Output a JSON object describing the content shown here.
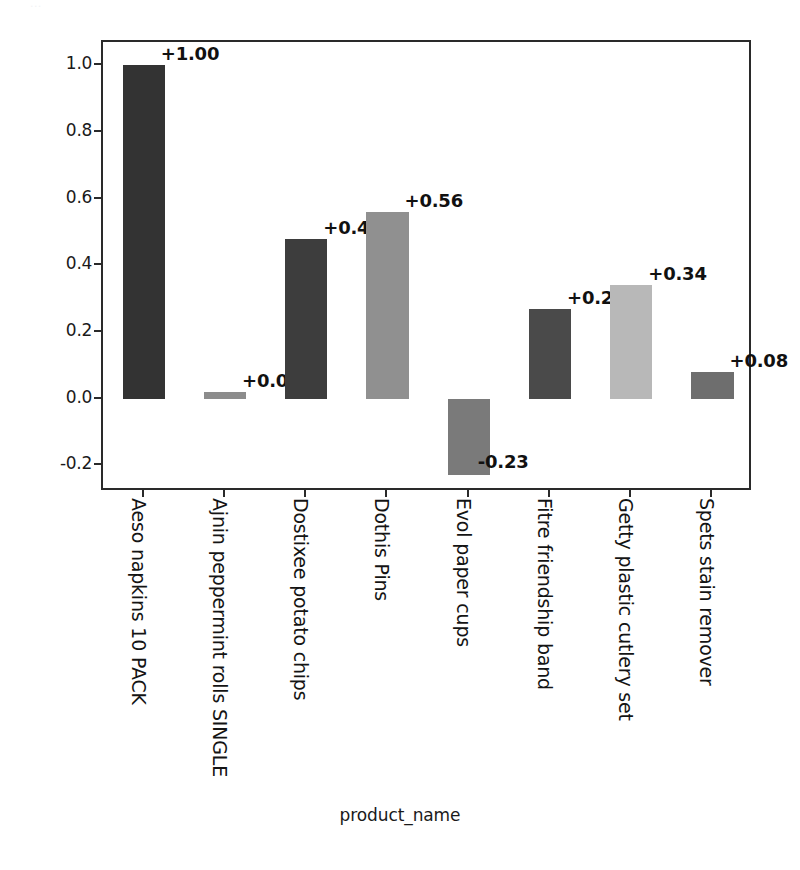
{
  "top_caption": "...",
  "chart_data": {
    "type": "bar",
    "title": "",
    "xlabel": "product_name",
    "ylabel": "",
    "categories": [
      "Aeso napkins 10 PACK",
      "Ajnin peppermint rolls SINGLE",
      "Dostixee potato chips",
      "Dothis Pins",
      "Evol paper cups",
      "Fitre friendship band",
      "Getty plastic cutlery set",
      "Spets stain remover"
    ],
    "values": [
      1.0,
      0.02,
      0.48,
      0.56,
      -0.23,
      0.27,
      0.34,
      0.08
    ],
    "value_labels": [
      "+1.00",
      "+0.02",
      "+0.48",
      "+0.56",
      "-0.23",
      "+0.27",
      "+0.34",
      "+0.08"
    ],
    "bar_colors": [
      "#333333",
      "#8c8c8c",
      "#3d3d3d",
      "#909090",
      "#7a7a7a",
      "#4a4a4a",
      "#b8b8b8",
      "#6e6e6e"
    ],
    "ylim": [
      -0.28,
      1.07
    ],
    "yticks": [
      1.0,
      0.8,
      0.6,
      0.4,
      0.2,
      0.0,
      -0.2
    ],
    "ytick_labels": [
      "1.0",
      "0.8",
      "0.6",
      "0.4",
      "0.2",
      "0.0",
      "-0.2"
    ],
    "grid": false,
    "legend": "none"
  }
}
